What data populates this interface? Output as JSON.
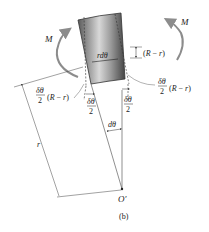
{
  "diagram": {
    "caption": "(b)",
    "element_label": "rdθ",
    "moment_left": "M",
    "moment_right": "M",
    "offset_label": "(R − r)",
    "shift_left": {
      "num": "δθ",
      "den": "2",
      "suffix": "(R − r)"
    },
    "shift_right": {
      "num": "δθ",
      "den": "2",
      "suffix": "(R − r)"
    },
    "half_angle_left": {
      "num": "δθ",
      "den": "2"
    },
    "half_angle_right": {
      "num": "δθ",
      "den": "2"
    },
    "angle_label": "dθ",
    "radius_label": "r",
    "center_label": "O′",
    "colors": {
      "element_dark": "#5a5a5a",
      "element_light": "#e6e6e6",
      "moment_arrow": "#8c8c8c",
      "lines": "#444444"
    }
  }
}
